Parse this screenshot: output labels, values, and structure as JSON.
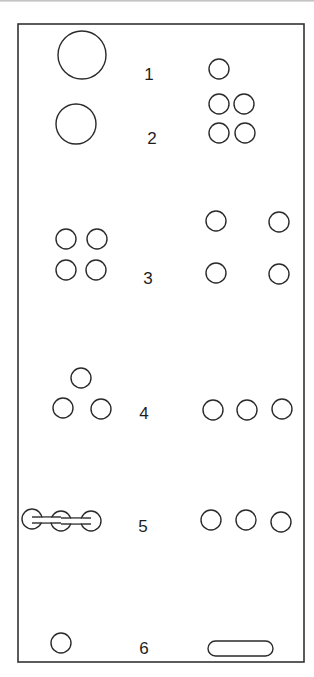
{
  "panel": {
    "x": 18,
    "y": 24,
    "width": 286,
    "height": 638,
    "stroke": "#333333"
  },
  "rows": [
    {
      "label": "1",
      "label_pos": [
        149,
        80
      ],
      "left": {
        "pattern": "single-large-hole",
        "circles": [
          [
            82,
            55,
            24
          ]
        ]
      },
      "right": {
        "pattern": "single-hole",
        "circles": [
          [
            219,
            69,
            10
          ]
        ]
      }
    },
    {
      "label": "2",
      "label_pos": [
        152,
        144
      ],
      "left": {
        "pattern": "single-medium-hole",
        "circles": [
          [
            76,
            124,
            20
          ]
        ]
      },
      "right": {
        "pattern": "2x2-grid",
        "circles": [
          [
            219,
            104,
            10
          ],
          [
            244,
            104,
            10
          ],
          [
            219,
            133,
            10
          ],
          [
            245,
            133,
            10
          ]
        ]
      }
    },
    {
      "label": "3",
      "label_pos": [
        148,
        284
      ],
      "left": {
        "pattern": "2x2-grid",
        "circles": [
          [
            66,
            239,
            10
          ],
          [
            97,
            239,
            10
          ],
          [
            66,
            270,
            10
          ],
          [
            96,
            270,
            10
          ]
        ]
      },
      "right": {
        "pattern": "2x2-wide-grid",
        "circles": [
          [
            216,
            221,
            10
          ],
          [
            279,
            222,
            10
          ],
          [
            216,
            273,
            10
          ],
          [
            279,
            274,
            10
          ]
        ]
      }
    },
    {
      "label": "4",
      "label_pos": [
        144,
        419
      ],
      "left": {
        "pattern": "triangle",
        "circles": [
          [
            81,
            378,
            10
          ],
          [
            63,
            408,
            10
          ],
          [
            101,
            409,
            10
          ]
        ]
      },
      "right": {
        "pattern": "row-of-three",
        "circles": [
          [
            213,
            410,
            10
          ],
          [
            247,
            410,
            10
          ],
          [
            282,
            409,
            10
          ]
        ]
      }
    },
    {
      "label": "5",
      "label_pos": [
        143,
        532
      ],
      "left": {
        "pattern": "linked-slot-three",
        "circles": [
          [
            32,
            519,
            10
          ],
          [
            61,
            521,
            10
          ],
          [
            91,
            521,
            10
          ]
        ],
        "connector_height": 6
      },
      "right": {
        "pattern": "row-of-three",
        "circles": [
          [
            211,
            520,
            10
          ],
          [
            246,
            520,
            10
          ],
          [
            281,
            522,
            10
          ]
        ]
      }
    },
    {
      "label": "6",
      "label_pos": [
        144,
        654
      ],
      "left": {
        "pattern": "single-hole",
        "circles": [
          [
            61,
            643,
            10
          ]
        ]
      },
      "right": {
        "pattern": "oblong-slot",
        "slot": {
          "x": 208,
          "y": 641,
          "width": 65,
          "height": 15
        }
      }
    }
  ]
}
